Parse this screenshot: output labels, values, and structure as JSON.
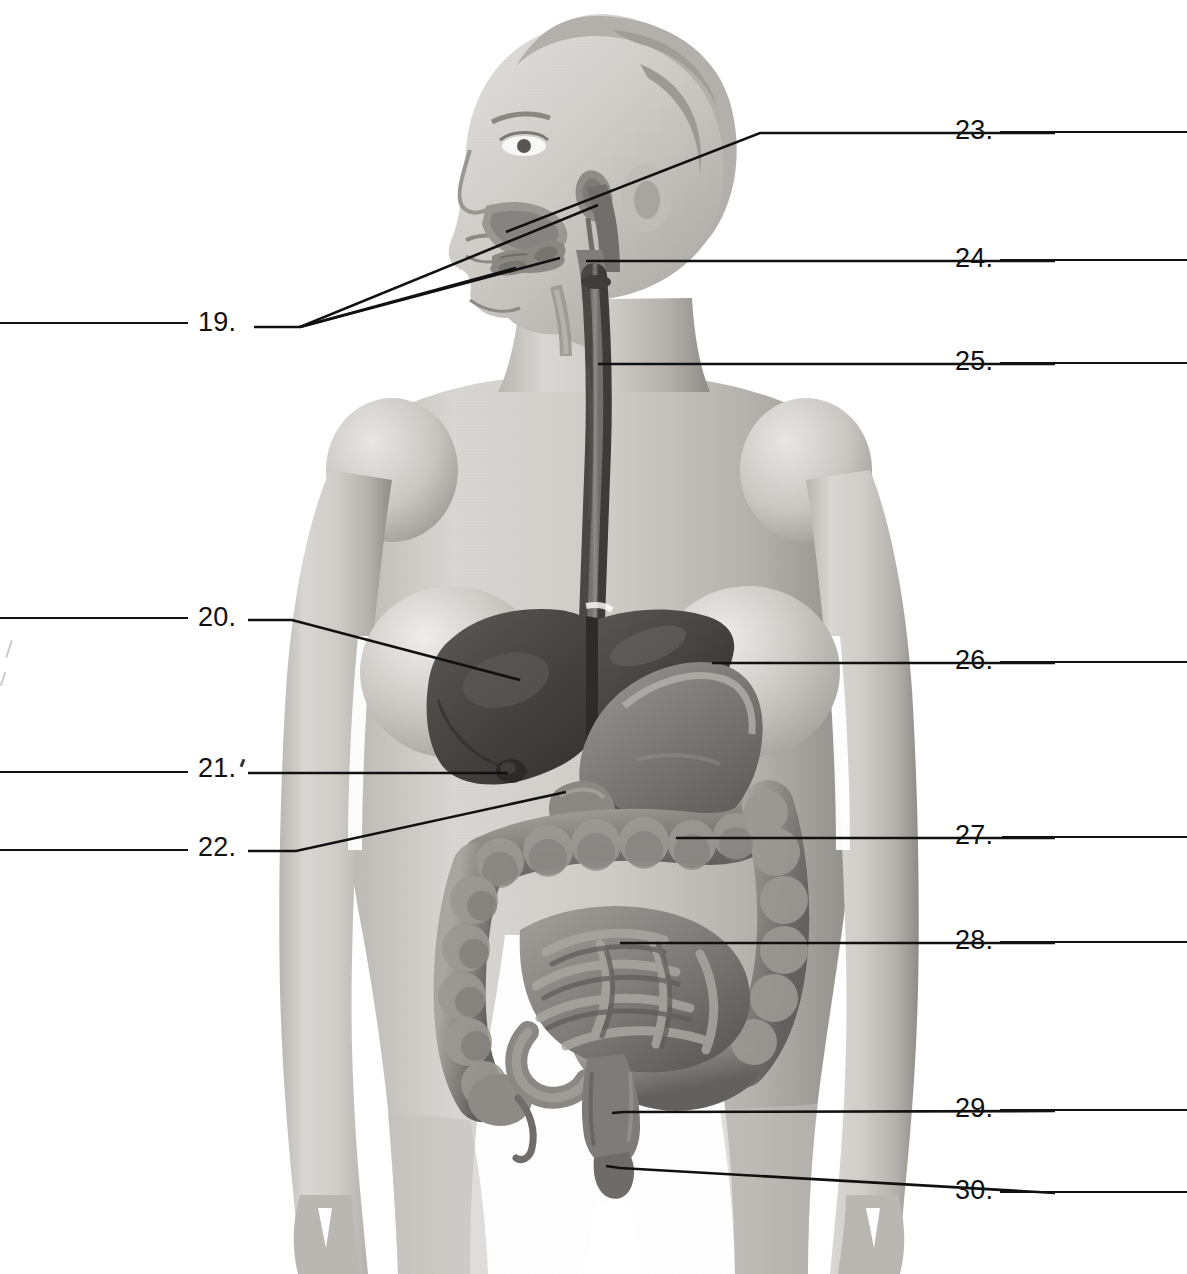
{
  "worksheet": {
    "title": "Digestive System Labeling Diagram",
    "figure_description": "Anterior view of a female human figure with the digestive organs shown in place; head in left profile revealing oral cavity, tongue, salivary glands and pharynx.",
    "numbering_start": 19,
    "numbering_end": 30
  },
  "left_labels": [
    {
      "number": "19.",
      "y": 322,
      "blank_line": true
    },
    {
      "number": "20.",
      "y": 617,
      "blank_line": true
    },
    {
      "number": "21.",
      "y": 768,
      "blank_line": true
    },
    {
      "number": "22.",
      "y": 847,
      "blank_line": true
    }
  ],
  "right_labels": [
    {
      "number": "23.",
      "y": 130,
      "blank_line": true
    },
    {
      "number": "24.",
      "y": 258,
      "blank_line": true
    },
    {
      "number": "25.",
      "y": 361,
      "blank_line": true
    },
    {
      "number": "26.",
      "y": 660,
      "blank_line": true
    },
    {
      "number": "27.",
      "y": 835,
      "blank_line": true
    },
    {
      "number": "28.",
      "y": 940,
      "blank_line": true
    },
    {
      "number": "29.",
      "y": 1108,
      "blank_line": true
    },
    {
      "number": "30.",
      "y": 1190,
      "blank_line": true
    }
  ],
  "colors": {
    "ink": "#111111",
    "line": "#111111",
    "skin_light": "#d8d6d2",
    "skin_mid": "#b5b2ad",
    "skin_shadow": "#8e8b86",
    "organ_dark": "#4d4b49",
    "organ_mid": "#777471",
    "organ_light": "#a5a29e",
    "background": "#ffffff"
  }
}
